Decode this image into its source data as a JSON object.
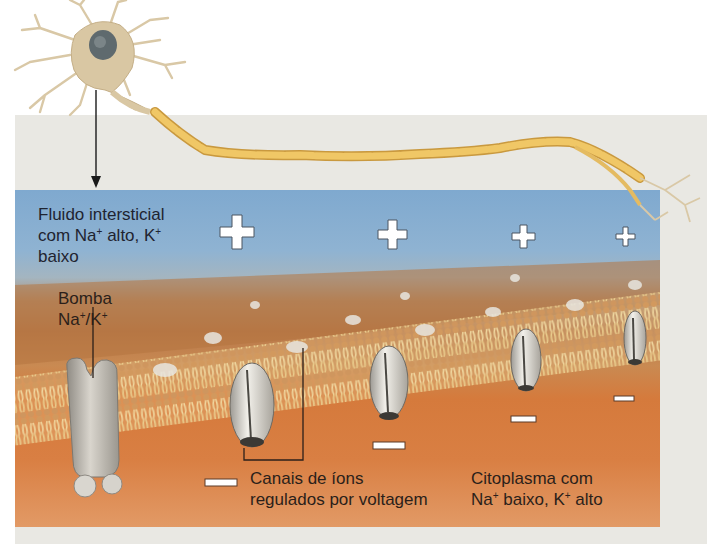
{
  "diagram": {
    "labels": {
      "interstitial": {
        "line1": "Fluido intersticial",
        "line2_a": "com Na",
        "line2_sup1": "+",
        "line2_b": " alto, K",
        "line2_sup2": "+",
        "line3": "baixo"
      },
      "pump": {
        "line1": "Bomba",
        "line2_a": "Na",
        "line2_sup1": "+",
        "line2_b": "/K",
        "line2_sup2": "+"
      },
      "channels": {
        "line1": "Canais de íons",
        "line2": "regulados por voltagem"
      },
      "cytoplasm": {
        "line1": "Citoplasma com",
        "line2_a": "Na",
        "line2_sup1": "+",
        "line2_b": " baixo, K",
        "line2_sup2": "+",
        "line2_c": " alto"
      }
    },
    "charges": {
      "outside": [
        "+",
        "+",
        "+",
        "+"
      ],
      "inside": [
        "−",
        "−",
        "−",
        "−"
      ]
    },
    "colors": {
      "extracellular": "#7fa9cf",
      "cytoplasm": "#d57a3c",
      "membrane": "#e2c48a",
      "axon": "#e6b85c",
      "panel_grey": "#e9e8e3"
    },
    "icons": [
      "neuron-icon",
      "arrow-down-icon",
      "sodium-potassium-pump-icon",
      "ion-channel-icon",
      "plus-sign-icon",
      "minus-sign-icon"
    ]
  }
}
